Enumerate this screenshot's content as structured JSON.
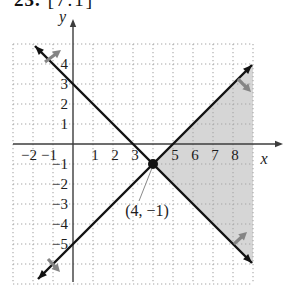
{
  "title": {
    "number": "23.",
    "reference": "[7.1]"
  },
  "colors": {
    "background": "#ffffff",
    "shade": "#d6d6d6",
    "grid": "#a6a6a6",
    "axis": "#3c3c3c",
    "line": "#121212",
    "arrow": "#858585",
    "leader": "#8a8a8a",
    "text": "#1c1c1c"
  },
  "chart_data": {
    "type": "line",
    "xlabel": "x",
    "ylabel": "y",
    "xlim": [
      -3,
      9
    ],
    "ylim": [
      -7,
      5
    ],
    "grid": "dotted",
    "x_tick_labels": [
      -2,
      -1,
      1,
      2,
      3,
      5,
      6,
      7,
      8
    ],
    "y_tick_labels": [
      4,
      3,
      2,
      1,
      -1,
      -2,
      -3,
      -4,
      -5
    ],
    "series": [
      {
        "name": "line-negative-slope",
        "equation": "y = -x + 3",
        "slope": -1,
        "intercept": 3,
        "points": [
          [
            -1.9,
            4.9
          ],
          [
            8.95,
            -5.95
          ]
        ]
      },
      {
        "name": "line-positive-slope",
        "equation": "y = x - 5",
        "slope": 1,
        "intercept": -5,
        "points": [
          [
            -1.75,
            -6.75
          ],
          [
            8.95,
            3.95
          ]
        ]
      }
    ],
    "intersection": {
      "x": 4,
      "y": -1,
      "label": "(4, −1)",
      "label_pos": [
        3.7,
        -3.6
      ],
      "leader": [
        [
          3.95,
          -1.2
        ],
        [
          3.3,
          -2.85
        ]
      ]
    },
    "shaded_region": {
      "vertices": [
        [
          4,
          -1
        ],
        [
          9,
          4
        ],
        [
          9,
          -6
        ]
      ],
      "description": "wedge right of intersection, between the two lines"
    },
    "direction_arrows": [
      {
        "from": [
          -1.4,
          4.1
        ],
        "to": [
          -0.6,
          4.7
        ]
      },
      {
        "from": [
          8.25,
          3.25
        ],
        "to": [
          8.9,
          2.6
        ]
      },
      {
        "from": [
          -1.25,
          -5.75
        ],
        "to": [
          -0.65,
          -6.4
        ]
      },
      {
        "from": [
          8.05,
          -5.0
        ],
        "to": [
          8.7,
          -4.4
        ]
      }
    ],
    "render": {
      "origin": [
        73,
        144
      ],
      "unit": 20,
      "x_axis_end": 283,
      "y_axis_top": 19,
      "y_axis_bottom": 282
    }
  }
}
